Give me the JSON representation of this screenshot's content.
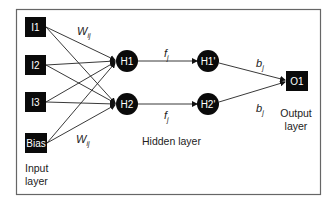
{
  "diagram": {
    "type": "neural-network",
    "input_layer": {
      "label_line1": "Input",
      "label_line2": "layer",
      "nodes": [
        "I1",
        "I2",
        "I3",
        "Bias"
      ]
    },
    "hidden_layer": {
      "label": "Hidden layer",
      "nodes": [
        "H1",
        "H2"
      ],
      "activated_nodes": [
        "H1'",
        "H2'"
      ]
    },
    "output_layer": {
      "label_line1": "Output",
      "label_line2": "layer",
      "nodes": [
        "O1"
      ]
    },
    "edge_labels": {
      "input_weight_top": {
        "base": "W",
        "sub": "ij"
      },
      "input_weight_bottom": {
        "base": "W",
        "sub": "ij"
      },
      "activation_top": {
        "base": "f",
        "sub": "j"
      },
      "activation_bottom": {
        "base": "f",
        "sub": "j"
      },
      "output_weight_top": {
        "base": "b",
        "sub": "j"
      },
      "output_weight_bottom": {
        "base": "b",
        "sub": "j"
      }
    },
    "colors": {
      "node_fill": "#0a0a0a",
      "node_text": "#ffffff",
      "edge": "#222222",
      "frame": "#666666",
      "background": "#ffffff"
    }
  }
}
